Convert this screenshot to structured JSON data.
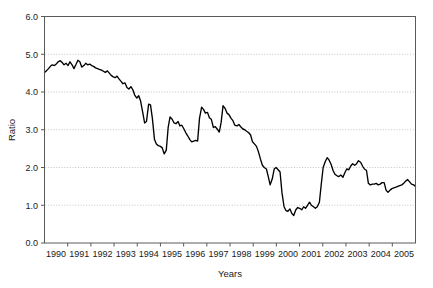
{
  "chart_data": {
    "type": "line",
    "title": "",
    "xlabel": "Years",
    "ylabel": "Ratio",
    "ylim": [
      0.0,
      6.0
    ],
    "ytick_step": 1.0,
    "ytick_labels": [
      "0.0",
      "1.0",
      "2.0",
      "3.0",
      "4.0",
      "5.0",
      "6.0"
    ],
    "ytick_values": [
      0.0,
      1.0,
      2.0,
      3.0,
      4.0,
      5.0,
      6.0
    ],
    "xtick_labels": [
      "1990",
      "1991",
      "1992",
      "1993",
      "1994",
      "1995",
      "1996",
      "1997",
      "1998",
      "1999",
      "2000",
      "2001",
      "2002",
      "2003",
      "2004",
      "2005"
    ],
    "xlim": [
      1990.0,
      2005.75
    ],
    "grid": "horizontal-dotted",
    "legend": "none",
    "line_color": "#000000",
    "axis_color": "#5a5a5a",
    "grid_color": "#b9b9b9",
    "series": [
      {
        "name": "Ratio",
        "x": [
          1990.0,
          1990.08,
          1990.17,
          1990.25,
          1990.33,
          1990.42,
          1990.5,
          1990.58,
          1990.67,
          1990.75,
          1990.83,
          1990.92,
          1991.0,
          1991.08,
          1991.17,
          1991.25,
          1991.33,
          1991.42,
          1991.5,
          1991.58,
          1991.67,
          1991.75,
          1991.83,
          1991.92,
          1992.0,
          1992.08,
          1992.17,
          1992.25,
          1992.33,
          1992.42,
          1992.5,
          1992.58,
          1992.67,
          1992.75,
          1992.83,
          1992.92,
          1993.0,
          1993.08,
          1993.17,
          1993.25,
          1993.33,
          1993.42,
          1993.5,
          1993.58,
          1993.67,
          1993.75,
          1993.83,
          1993.92,
          1994.0,
          1994.08,
          1994.17,
          1994.25,
          1994.33,
          1994.42,
          1994.5,
          1994.58,
          1994.67,
          1994.75,
          1994.83,
          1994.92,
          1995.0,
          1995.08,
          1995.17,
          1995.25,
          1995.33,
          1995.42,
          1995.5,
          1995.58,
          1995.67,
          1995.75,
          1995.83,
          1995.92,
          1996.0,
          1996.08,
          1996.17,
          1996.25,
          1996.33,
          1996.42,
          1996.5,
          1996.58,
          1996.67,
          1996.75,
          1996.83,
          1996.92,
          1997.0,
          1997.08,
          1997.17,
          1997.25,
          1997.33,
          1997.42,
          1997.5,
          1997.58,
          1997.67,
          1997.75,
          1997.83,
          1997.92,
          1998.0,
          1998.08,
          1998.17,
          1998.25,
          1998.33,
          1998.42,
          1998.5,
          1998.58,
          1998.67,
          1998.75,
          1998.83,
          1998.92,
          1999.0,
          1999.08,
          1999.17,
          1999.25,
          1999.33,
          1999.42,
          1999.5,
          1999.58,
          1999.67,
          1999.75,
          1999.83,
          1999.92,
          2000.0,
          2000.08,
          2000.17,
          2000.25,
          2000.33,
          2000.42,
          2000.5,
          2000.58,
          2000.67,
          2000.75,
          2000.83,
          2000.92,
          2001.0,
          2001.08,
          2001.17,
          2001.25,
          2001.33,
          2001.42,
          2001.5,
          2001.58,
          2001.67,
          2001.75,
          2001.83,
          2001.92,
          2002.0,
          2002.08,
          2002.17,
          2002.25,
          2002.33,
          2002.42,
          2002.5,
          2002.58,
          2002.67,
          2002.75,
          2002.83,
          2002.92,
          2003.0,
          2003.08,
          2003.17,
          2003.25,
          2003.33,
          2003.42,
          2003.5,
          2003.58,
          2003.67,
          2003.75,
          2003.83,
          2003.92,
          2004.0,
          2004.08,
          2004.17,
          2004.25,
          2004.33,
          2004.42,
          2004.5,
          2004.58,
          2004.67,
          2004.75,
          2004.83,
          2004.92,
          2005.0,
          2005.08,
          2005.17,
          2005.25,
          2005.33,
          2005.42,
          2005.5,
          2005.58,
          2005.67,
          2005.75
        ],
        "values": [
          4.52,
          4.56,
          4.62,
          4.68,
          4.72,
          4.7,
          4.74,
          4.8,
          4.83,
          4.78,
          4.72,
          4.76,
          4.7,
          4.8,
          4.72,
          4.62,
          4.72,
          4.84,
          4.8,
          4.66,
          4.7,
          4.76,
          4.72,
          4.74,
          4.7,
          4.68,
          4.64,
          4.62,
          4.6,
          4.58,
          4.55,
          4.52,
          4.56,
          4.5,
          4.44,
          4.4,
          4.38,
          4.42,
          4.34,
          4.28,
          4.22,
          4.24,
          4.12,
          4.08,
          4.14,
          4.06,
          3.92,
          3.84,
          3.9,
          3.76,
          3.46,
          3.18,
          3.22,
          3.68,
          3.66,
          3.3,
          2.74,
          2.62,
          2.58,
          2.56,
          2.52,
          2.36,
          2.46,
          3.06,
          3.34,
          3.28,
          3.18,
          3.16,
          3.22,
          3.1,
          3.12,
          3.02,
          2.92,
          2.84,
          2.74,
          2.68,
          2.7,
          2.72,
          2.7,
          3.3,
          3.6,
          3.54,
          3.44,
          3.46,
          3.32,
          3.28,
          3.06,
          3.08,
          3.02,
          2.94,
          3.2,
          3.64,
          3.56,
          3.44,
          3.4,
          3.3,
          3.24,
          3.12,
          3.1,
          3.14,
          3.08,
          3.02,
          3.0,
          2.96,
          2.92,
          2.86,
          2.68,
          2.62,
          2.56,
          2.42,
          2.22,
          2.06,
          2.0,
          1.96,
          1.76,
          1.54,
          1.7,
          1.96,
          2.0,
          1.94,
          1.88,
          1.34,
          0.96,
          0.86,
          0.84,
          0.9,
          0.78,
          0.73,
          0.88,
          0.94,
          0.92,
          0.88,
          0.96,
          0.92,
          1.0,
          1.08,
          1.0,
          0.96,
          0.92,
          0.96,
          1.08,
          1.56,
          2.0,
          2.16,
          2.26,
          2.2,
          2.08,
          1.92,
          1.82,
          1.78,
          1.76,
          1.8,
          1.74,
          1.86,
          1.96,
          1.94,
          2.04,
          2.1,
          2.06,
          2.1,
          2.18,
          2.14,
          2.04,
          1.96,
          1.92,
          1.58,
          1.54,
          1.56,
          1.56,
          1.58,
          1.54,
          1.56,
          1.6,
          1.6,
          1.4,
          1.34,
          1.4,
          1.44,
          1.46,
          1.48,
          1.5,
          1.52,
          1.54,
          1.58,
          1.64,
          1.68,
          1.62,
          1.56,
          1.54,
          1.5
        ]
      }
    ]
  }
}
